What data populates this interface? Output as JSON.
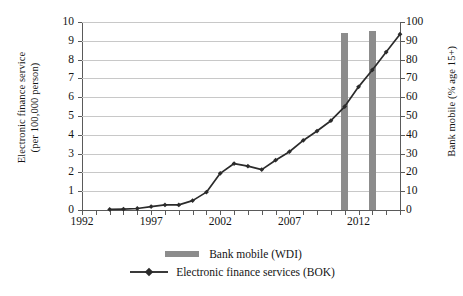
{
  "chart_data": {
    "type": "line",
    "title": "",
    "xlabel": "",
    "grid": true,
    "legend_position": "bottom",
    "x_tick_labels": [
      "1992",
      "1997",
      "2002",
      "2007",
      "2012"
    ],
    "x_ticks": [
      1992,
      1997,
      2002,
      2007,
      2012
    ],
    "xlim": [
      1992,
      2015
    ],
    "axes": [
      {
        "id": "left",
        "label_line1": "Electronic finance service",
        "label_line2": "(per 100,000 person)",
        "ylim": [
          0,
          10
        ],
        "tick_labels": [
          "0",
          "1",
          "2",
          "3",
          "4",
          "5",
          "6",
          "7",
          "8",
          "9",
          "10"
        ],
        "tick_values": [
          0,
          1,
          2,
          3,
          4,
          5,
          6,
          7,
          8,
          9,
          10
        ]
      },
      {
        "id": "right",
        "label": "Bank mobile (% age  15+)",
        "ylim": [
          0,
          100
        ],
        "tick_labels": [
          "0",
          "10",
          "20",
          "30",
          "40",
          "50",
          "60",
          "70",
          "80",
          "90",
          "100"
        ],
        "tick_values": [
          0,
          10,
          20,
          30,
          40,
          50,
          60,
          70,
          80,
          90,
          100
        ]
      }
    ],
    "series": [
      {
        "name": "Bank mobile (WDI)",
        "type": "bar",
        "axis": "right",
        "color": "#8c8c8c",
        "x": [
          2011,
          2013
        ],
        "values": [
          94,
          95
        ]
      },
      {
        "name": "Electronic finance services (BOK)",
        "type": "line",
        "axis": "left",
        "color": "#2b2b2b",
        "marker": "diamond",
        "x": [
          1994,
          1995,
          1996,
          1997,
          1998,
          1999,
          2000,
          2001,
          2002,
          2003,
          2004,
          2005,
          2006,
          2007,
          2008,
          2009,
          2010,
          2011,
          2012,
          2013,
          2014,
          2015
        ],
        "values": [
          0.03,
          0.05,
          0.08,
          0.18,
          0.27,
          0.27,
          0.5,
          0.95,
          1.95,
          2.47,
          2.33,
          2.15,
          2.65,
          3.1,
          3.7,
          4.2,
          4.75,
          5.5,
          6.55,
          7.45,
          8.4,
          9.35
        ]
      }
    ]
  },
  "legend": {
    "items": [
      {
        "label": "Bank mobile (WDI)",
        "kind": "bar-swatch",
        "color": "#8c8c8c"
      },
      {
        "label": "Electronic finance services (BOK)",
        "kind": "line-swatch",
        "color": "#2b2b2b"
      }
    ]
  }
}
